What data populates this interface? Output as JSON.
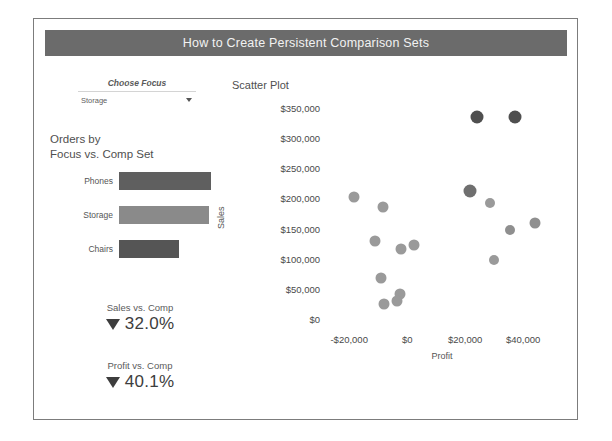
{
  "header": {
    "title": "How to Create Persistent Comparison Sets",
    "background": "#6b6b6b",
    "text_color": "#f2f2f2"
  },
  "filter": {
    "label": "Choose Focus",
    "selected_value": "Storage",
    "arrow_icon": "chevron-down-icon",
    "options": [
      "Storage"
    ]
  },
  "bar_panel": {
    "title_line1": "Orders by",
    "title_line2": "Focus vs. Comp Set"
  },
  "kpis": [
    {
      "label": "Sales vs. Comp",
      "value": "32.0%",
      "direction": "down",
      "arrow_icon": "triangle-down-icon",
      "color": "#3d3d3d"
    },
    {
      "label": "Profit vs. Comp",
      "value": "40.1%",
      "direction": "down",
      "arrow_icon": "triangle-down-icon",
      "color": "#3d3d3d"
    }
  ],
  "chart_data": [
    {
      "type": "bar",
      "title": "Orders by Focus vs. Comp Set",
      "orientation": "horizontal",
      "xlabel": "",
      "ylabel": "",
      "categories": [
        "Phones",
        "Storage",
        "Chairs"
      ],
      "values": [
        94,
        92,
        61
      ],
      "xlim": [
        0,
        100
      ],
      "grid": false,
      "colors": [
        "#5f5f5f",
        "#8a8a8a",
        "#555555"
      ]
    },
    {
      "type": "scatter",
      "title": "Scatter Plot",
      "xlabel": "Profit",
      "ylabel": "Sales",
      "grid": false,
      "legend": "none",
      "xlim": [
        -28000,
        52000
      ],
      "ylim": [
        -12000,
        362000
      ],
      "xticks": [
        -20000,
        0,
        20000,
        40000
      ],
      "xtick_labels": [
        "-$20,000",
        "$0",
        "$20,000",
        "$40,000"
      ],
      "yticks": [
        0,
        50000,
        100000,
        150000,
        200000,
        250000,
        300000,
        350000
      ],
      "ytick_labels": [
        "$0",
        "$50,000",
        "$100,000",
        "$150,000",
        "$200,000",
        "$250,000",
        "$300,000",
        "$350,000"
      ],
      "points": [
        {
          "x": 24000,
          "y": 336000,
          "color": "#4f4f4f",
          "size": 13
        },
        {
          "x": 37000,
          "y": 336000,
          "color": "#4f4f4f",
          "size": 13
        },
        {
          "x": 21500,
          "y": 212000,
          "color": "#6f6f6f",
          "size": 13
        },
        {
          "x": -18500,
          "y": 203000,
          "color": "#9a9a9a",
          "size": 11
        },
        {
          "x": 28500,
          "y": 192000,
          "color": "#9a9a9a",
          "size": 10
        },
        {
          "x": 44000,
          "y": 160000,
          "color": "#8f8f8f",
          "size": 11
        },
        {
          "x": -8500,
          "y": 185000,
          "color": "#9a9a9a",
          "size": 11
        },
        {
          "x": 35500,
          "y": 147000,
          "color": "#8f8f8f",
          "size": 10
        },
        {
          "x": -11000,
          "y": 130000,
          "color": "#9a9a9a",
          "size": 11
        },
        {
          "x": -2000,
          "y": 116000,
          "color": "#9a9a9a",
          "size": 11
        },
        {
          "x": 2500,
          "y": 123000,
          "color": "#9a9a9a",
          "size": 11
        },
        {
          "x": 30000,
          "y": 97000,
          "color": "#9a9a9a",
          "size": 10
        },
        {
          "x": -9000,
          "y": 68000,
          "color": "#9a9a9a",
          "size": 11
        },
        {
          "x": -2500,
          "y": 42000,
          "color": "#9a9a9a",
          "size": 11
        },
        {
          "x": -3500,
          "y": 30000,
          "color": "#9a9a9a",
          "size": 11
        },
        {
          "x": -8000,
          "y": 25000,
          "color": "#9a9a9a",
          "size": 11
        }
      ]
    }
  ]
}
